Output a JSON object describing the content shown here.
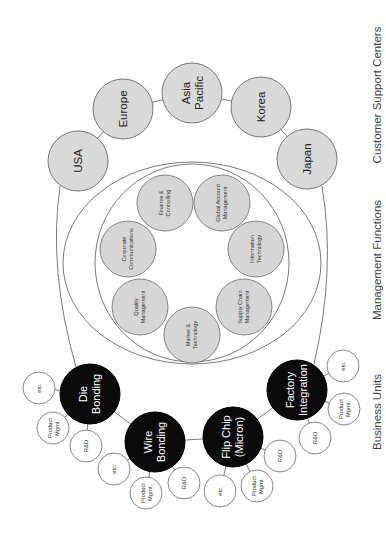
{
  "section_labels": [
    {
      "text": "Customer Support Centers",
      "x": 377,
      "y": 95
    },
    {
      "text": "Management Functions",
      "x": 377,
      "y": 260
    },
    {
      "text": "Business Units",
      "x": 377,
      "y": 412
    }
  ],
  "colors": {
    "customer_fill": "#d9d9d9",
    "management_fill": "#d6d6d6",
    "business_unit_fill": "#0a0a0a",
    "sub_unit_fill": "#ffffff",
    "line": "#6b6b6b"
  },
  "customer_support_centers": [
    {
      "label": [
        "USA"
      ],
      "x": 78,
      "y": 161,
      "r": 30
    },
    {
      "label": [
        "Europe"
      ],
      "x": 123,
      "y": 109,
      "r": 30
    },
    {
      "label": [
        "Asia",
        "Pacific"
      ],
      "x": 192,
      "y": 93,
      "r": 30
    },
    {
      "label": [
        "Korea"
      ],
      "x": 261,
      "y": 107,
      "r": 30
    },
    {
      "label": [
        "Japan"
      ],
      "x": 307,
      "y": 159,
      "r": 30
    }
  ],
  "management_functions": [
    {
      "label": [
        "Finance &",
        "Controlling"
      ],
      "x": 165,
      "y": 203,
      "r": 28
    },
    {
      "label": [
        "Global Account",
        "Management"
      ],
      "x": 222,
      "y": 203,
      "r": 28
    },
    {
      "label": [
        "Information",
        "Technology"
      ],
      "x": 256,
      "y": 249,
      "r": 28
    },
    {
      "label": [
        "Supply Chain",
        "Management"
      ],
      "x": 244,
      "y": 307,
      "r": 28
    },
    {
      "label": [
        "Market &",
        "Technology"
      ],
      "x": 192,
      "y": 335,
      "r": 28
    },
    {
      "label": [
        "Quality",
        "Management"
      ],
      "x": 140,
      "y": 307,
      "r": 28
    },
    {
      "label": [
        "Corporate",
        "Communications"
      ],
      "x": 128,
      "y": 249,
      "r": 28
    }
  ],
  "business_units": [
    {
      "label": [
        "Die",
        "Bonding"
      ],
      "x": 90,
      "y": 394,
      "r": 30,
      "sub_units": [
        {
          "label": [
            "etc."
          ],
          "x": 39,
          "y": 388
        },
        {
          "label": [
            "Product",
            "Mgmt."
          ],
          "x": 53,
          "y": 428
        },
        {
          "label": [
            "R&D"
          ],
          "x": 86,
          "y": 446
        }
      ]
    },
    {
      "label": [
        "Wire",
        "Bonding"
      ],
      "x": 155,
      "y": 442,
      "r": 30,
      "sub_units": [
        {
          "label": [
            "etc."
          ],
          "x": 114,
          "y": 469
        },
        {
          "label": [
            "Product",
            "Mgmt."
          ],
          "x": 146,
          "y": 493
        },
        {
          "label": [
            "R&D"
          ],
          "x": 184,
          "y": 483
        }
      ]
    },
    {
      "label": [
        "Flip Chip",
        "(Micron)"
      ],
      "x": 233,
      "y": 437,
      "r": 30,
      "sub_units": [
        {
          "label": [
            "etc."
          ],
          "x": 220,
          "y": 491
        },
        {
          "label": [
            "Product",
            "Mgmt."
          ],
          "x": 257,
          "y": 486
        },
        {
          "label": [
            "R&D"
          ],
          "x": 280,
          "y": 456
        }
      ]
    },
    {
      "label": [
        "Factory",
        "Integration"
      ],
      "x": 297,
      "y": 390,
      "r": 30,
      "sub_units": [
        {
          "label": [
            "R&D"
          ],
          "x": 315,
          "y": 438
        },
        {
          "label": [
            "Product",
            "Mgmt."
          ],
          "x": 344,
          "y": 409
        },
        {
          "label": [
            "etc."
          ],
          "x": 343,
          "y": 366
        }
      ]
    }
  ],
  "sub_unit_radius": 16
}
